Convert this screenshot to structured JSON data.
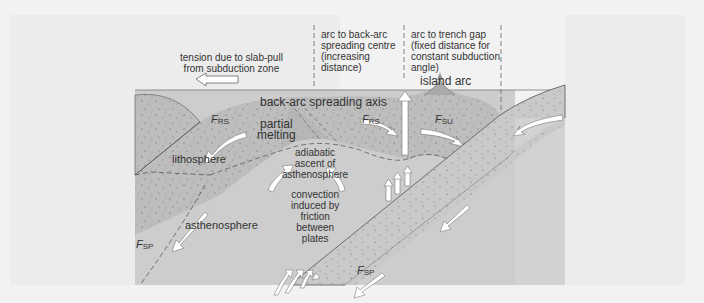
{
  "diagram": {
    "type": "back-arc spreading / subduction zone cross-section",
    "colors": {
      "background": "#f2f2f2",
      "panel": "#eaeaea",
      "lithosphere": "#bdbdbd",
      "asthenosphere": "#cfcfcf",
      "slab": "#b8b8b8",
      "arrow_fill": "#ffffff",
      "text": "#333333"
    },
    "labels": {
      "tension": "tension due to slab-pull\nfrom subduction zone",
      "arc_to_backarc": "arc to back-arc\nspreading centre\n(increasing\ndistance)",
      "arc_to_trench": "arc to trench gap\n(fixed distance for\nconstant subduction\nangle)",
      "island_arc": "island arc",
      "spreading_axis": "back-arc spreading axis",
      "partial_melting": "partial\nmelting",
      "lithosphere": "lithosphere",
      "adiabatic": "adiabatic\nascent of\nasthenosphere",
      "convection": "convection\ninduced by\nfriction\nbetween\nplates",
      "asthenosphere": "asthenosphere"
    },
    "forces": {
      "frs_left": {
        "symbol": "F",
        "sub": "RS"
      },
      "frs_right": {
        "symbol": "F",
        "sub": "RS"
      },
      "fsu": {
        "symbol": "F",
        "sub": "SU"
      },
      "fsp_left": {
        "symbol": "F",
        "sub": "SP"
      },
      "fsp_slab": {
        "symbol": "F",
        "sub": "SP"
      }
    }
  }
}
